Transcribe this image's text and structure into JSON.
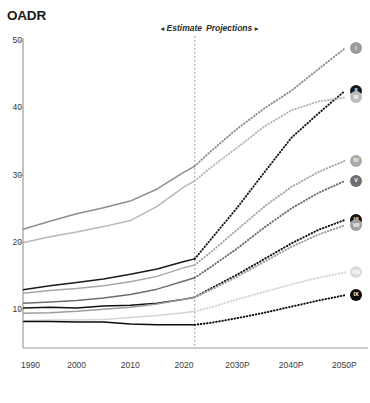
{
  "chart": {
    "title": "OADR",
    "phase": {
      "estimate_label": "Estimate",
      "estimate_arrow": "◂",
      "projections_label": "Projections",
      "projections_arrow": "▸",
      "divider_year": 2022
    }
  },
  "chart_data": {
    "type": "line",
    "title": "OADR",
    "xlabel": "",
    "ylabel": "OADR",
    "xlim": [
      1990,
      2050
    ],
    "ylim": [
      0,
      50
    ],
    "yticks": [
      10,
      20,
      30,
      40,
      50
    ],
    "ytick_labels": [
      "10",
      "20",
      "30",
      "40",
      "50"
    ],
    "xticks": [
      1990,
      2000,
      2010,
      2020,
      2030,
      2040,
      2050
    ],
    "xtick_labels": [
      "1990",
      "2000",
      "2010",
      "2020",
      "2030P",
      "2040P",
      "2050P"
    ],
    "grid": false,
    "legend": "end-of-line-badges",
    "annotations": [
      {
        "text": "Estimate",
        "x": 2012,
        "y": 50,
        "style": "italic-bold"
      },
      {
        "text": "Projections",
        "x": 2032,
        "y": 50,
        "style": "italic-bold"
      },
      {
        "text": "divider",
        "x": 2022,
        "style": "dotted-vertical"
      }
    ],
    "estimate_range": [
      1990,
      2022
    ],
    "projection_range": [
      2022,
      2050
    ],
    "x": [
      1990,
      1995,
      2000,
      2005,
      2010,
      2015,
      2020,
      2022,
      2025,
      2030,
      2035,
      2040,
      2045,
      2050
    ],
    "series": [
      {
        "name": "I",
        "label": "I",
        "color": "#8e8e8e",
        "badge_fill": "#9a9a9a",
        "badge_text": "#ffffff",
        "badge_label": "I",
        "values": [
          22.0,
          23.2,
          24.3,
          25.2,
          26.2,
          28.0,
          30.5,
          31.4,
          33.6,
          37.0,
          40.0,
          42.6,
          45.8,
          48.9
        ]
      },
      {
        "name": "II",
        "label": "II",
        "color": "#1a1a1a",
        "badge_fill": "#1a1a1a",
        "badge_text": "#ffffff",
        "badge_label": "II",
        "values": [
          13.0,
          13.6,
          14.1,
          14.6,
          15.3,
          16.1,
          17.2,
          17.6,
          20.5,
          25.3,
          30.5,
          35.6,
          39.2,
          42.6
        ]
      },
      {
        "name": "III",
        "label": "III",
        "color": "#b8b8b8",
        "badge_fill": "#bcbcbc",
        "badge_text": "#ffffff",
        "badge_label": "III",
        "values": [
          20.0,
          20.9,
          21.6,
          22.4,
          23.3,
          25.4,
          28.3,
          29.2,
          31.2,
          34.2,
          37.3,
          39.7,
          41.0,
          41.6
        ]
      },
      {
        "name": "IV",
        "label": "IV",
        "color": "#a8a8a8",
        "badge_fill": "#aaaaaa",
        "badge_text": "#ffffff",
        "badge_label": "IV",
        "values": [
          12.5,
          12.9,
          13.2,
          13.6,
          14.2,
          15.0,
          16.3,
          16.7,
          18.6,
          22.0,
          25.4,
          28.3,
          30.5,
          32.2
        ]
      },
      {
        "name": "V",
        "label": "V",
        "color": "#6e6e6e",
        "badge_fill": "#6e6e6e",
        "badge_text": "#ffffff",
        "badge_label": "V",
        "values": [
          11.0,
          11.2,
          11.4,
          11.8,
          12.3,
          13.1,
          14.3,
          14.8,
          16.4,
          19.2,
          22.3,
          25.1,
          27.4,
          29.2
        ]
      },
      {
        "name": "VI",
        "label": "VI",
        "color": "#121212",
        "badge_fill": "#121212",
        "badge_text": "#ffffff",
        "badge_label": "VI",
        "values": [
          10.3,
          10.4,
          10.3,
          10.6,
          10.7,
          11.0,
          11.6,
          11.9,
          13.2,
          15.3,
          17.6,
          19.9,
          21.9,
          23.4
        ]
      },
      {
        "name": "VII",
        "label": "VII",
        "color": "#9c9c9c",
        "badge_fill": "#a0a0a0",
        "badge_text": "#ffffff",
        "badge_label": "VII",
        "values": [
          9.5,
          9.6,
          9.8,
          10.1,
          10.4,
          10.9,
          11.6,
          11.9,
          13.0,
          15.0,
          17.2,
          19.4,
          21.2,
          22.6
        ]
      },
      {
        "name": "VIII",
        "label": "VIII",
        "color": "#d4d4d4",
        "badge_fill": "#dcdcdc",
        "badge_text": "#ffffff",
        "badge_label": "VIII",
        "values": [
          8.4,
          8.5,
          8.5,
          8.6,
          8.9,
          9.2,
          9.6,
          9.8,
          10.4,
          11.6,
          12.7,
          13.8,
          14.8,
          15.6
        ]
      },
      {
        "name": "IX",
        "label": "IX",
        "color": "#0d0d0d",
        "badge_fill": "#0d0d0d",
        "badge_text": "#ffffff",
        "badge_label": "IX",
        "values": [
          8.3,
          8.3,
          8.2,
          8.2,
          7.9,
          7.8,
          7.8,
          7.8,
          8.1,
          8.8,
          9.6,
          10.5,
          11.4,
          12.2
        ]
      }
    ]
  }
}
